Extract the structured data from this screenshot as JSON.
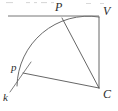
{
  "figure": {
    "background_color": "#ffffff",
    "line_color": "#555555",
    "arc_color": "#6a6a6a",
    "label_color": "#2b2b2b",
    "width": 118,
    "height": 111
  },
  "labels": {
    "point_p_upper": "P",
    "point_v": "V",
    "point_p_lower": "p",
    "point_k": "k",
    "point_c": "C"
  },
  "points": {
    "P": {
      "x": 62,
      "y": 18
    },
    "V": {
      "x": 99,
      "y": 17
    },
    "p": {
      "x": 23,
      "y": 73
    },
    "C": {
      "x": 99,
      "y": 88
    },
    "k_end": {
      "x": 10,
      "y": 92
    },
    "k_start": {
      "x": 31,
      "y": 62
    },
    "axis_left": {
      "x": 8,
      "y": 16
    },
    "arc_end_lower": {
      "x": 17,
      "y": 86
    }
  },
  "label_positions": {
    "P": {
      "x": 55,
      "y": 11
    },
    "V": {
      "x": 103,
      "y": 15
    },
    "p": {
      "x": 11,
      "y": 71
    },
    "k": {
      "x": 3,
      "y": 101
    },
    "C": {
      "x": 103,
      "y": 98
    }
  },
  "segments": [
    {
      "name": "horizontal-axis-line",
      "from": "axis_left",
      "to": "V"
    },
    {
      "name": "vertical-line-v-to-c",
      "from": "V",
      "to": "C"
    },
    {
      "name": "diagonal-line-p-to-c",
      "from": "P",
      "to": "C"
    },
    {
      "name": "line-lowercase-p-to-c",
      "from": "p",
      "to": "C"
    },
    {
      "name": "ray-k",
      "from": "k_start",
      "to": "k_end"
    }
  ],
  "arc": {
    "name": "quarter-circle-arc",
    "center": {
      "x": 99,
      "y": 88
    },
    "radius": 71,
    "start": {
      "x": 99,
      "y": 17
    },
    "end": {
      "x": 17,
      "y": 86
    }
  }
}
